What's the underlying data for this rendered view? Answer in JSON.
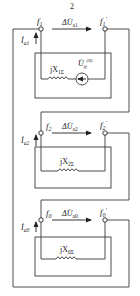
{
  "figure": {
    "top_label": "2",
    "line_color": "#3a3a3a",
    "sections": [
      {
        "id": "positive",
        "node_left": "f",
        "node_left_sub": "1",
        "node_right": "f",
        "node_right_sub": "1",
        "node_right_prime": "′",
        "voltage_label": "ΔU̇",
        "voltage_sub": "a1",
        "current_label": "İ",
        "current_sub": "a1",
        "reactance_label": "jX",
        "reactance_sub": "1Σ",
        "source_label": "U̇",
        "source_sub": "ff",
        "source_sup": "(0)"
      },
      {
        "id": "negative",
        "node_left": "f",
        "node_left_sub": "2",
        "node_right": "f",
        "node_right_sub": "2",
        "node_right_prime": "′",
        "voltage_label": "ΔU̇",
        "voltage_sub": "a2",
        "current_label": "İ",
        "current_sub": "a2",
        "reactance_label": "jX",
        "reactance_sub": "2Σ"
      },
      {
        "id": "zero",
        "node_left": "f",
        "node_left_sub": "0",
        "node_right": "f",
        "node_right_sub": "0",
        "node_right_prime": "′",
        "voltage_label": "ΔU̇",
        "voltage_sub": "a0",
        "current_label": "İ",
        "current_sub": "a0",
        "reactance_label": "jX",
        "reactance_sub": "0Σ"
      }
    ]
  }
}
